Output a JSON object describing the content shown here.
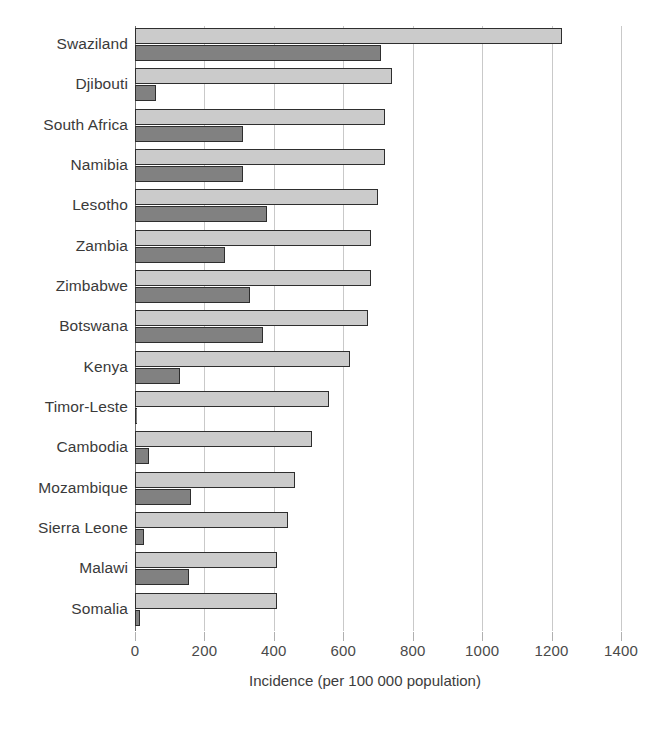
{
  "chart_data": {
    "type": "bar",
    "orientation": "horizontal",
    "title": "",
    "subtitle": "",
    "xlabel": "Incidence (per 100 000 population)",
    "ylabel": "",
    "xlim": [
      0,
      1400
    ],
    "xticks": [
      0,
      200,
      400,
      600,
      800,
      1000,
      1200,
      1400
    ],
    "xtick_labels": [
      "0",
      "200",
      "400",
      "600",
      "800",
      "1000",
      "1200",
      "1400"
    ],
    "grid": true,
    "legend": null,
    "legend_position": "none",
    "categories": [
      "Swaziland",
      "Djibouti",
      "South Africa",
      "Namibia",
      "Lesotho",
      "Zambia",
      "Zimbabwe",
      "Botswana",
      "Kenya",
      "Timor-Leste",
      "Cambodia",
      "Mozambique",
      "Sierra Leone",
      "Malawi",
      "Somalia"
    ],
    "series": [
      {
        "name": "series-light",
        "color": "#cbcbcb",
        "values": [
          1230,
          740,
          720,
          720,
          700,
          680,
          680,
          670,
          620,
          560,
          510,
          460,
          440,
          410,
          410
        ]
      },
      {
        "name": "series-dark",
        "color": "#818181",
        "values": [
          710,
          60,
          310,
          310,
          380,
          260,
          330,
          370,
          130,
          5,
          40,
          160,
          25,
          155,
          15
        ]
      }
    ]
  }
}
